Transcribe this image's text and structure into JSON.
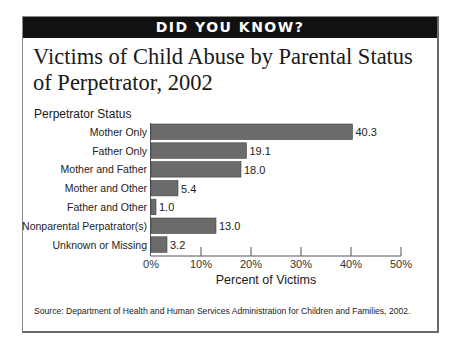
{
  "banner": "DID YOU KNOW?",
  "source": "Source:  Department of Health and Human Services Administration for Children and Families, 2002.",
  "chart_data": {
    "type": "bar",
    "orientation": "horizontal",
    "title": "Victims of Child Abuse by Parental Status of Perpetrator, 2002",
    "ylabel": "Perpetrator Status",
    "xlabel": "Percent of Victims",
    "categories": [
      "Mother Only",
      "Father Only",
      "Mother and Father",
      "Mother and Other",
      "Father and Other",
      "Nonparental Perpatrator(s)",
      "Unknown or Missing"
    ],
    "values": [
      40.3,
      19.1,
      18.0,
      5.4,
      1.0,
      13.0,
      3.2
    ],
    "value_labels": [
      "40.3",
      "19.1",
      "18.0",
      "5.4",
      "1.0",
      "13.0",
      "3.2"
    ],
    "xlim": [
      0,
      50
    ],
    "xticks": [
      0,
      10,
      20,
      30,
      40,
      50
    ],
    "xtick_labels": [
      "0%",
      "10%",
      "20%",
      "30%",
      "40%",
      "50%"
    ],
    "grid": false,
    "legend": "none",
    "bar_color": "#6b6b6b"
  }
}
